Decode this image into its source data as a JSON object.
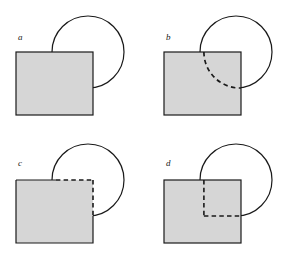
{
  "figure": {
    "title": "",
    "canvas": {
      "width": 296,
      "height": 256,
      "background": "#ffffff"
    },
    "colors": {
      "square_fill": "#d6d6d6",
      "outline": "#1a1a1a",
      "background": "#ffffff"
    },
    "panels": [
      {
        "label": "a",
        "label_x": 18,
        "label_y": 40,
        "description": "square overlapping circle, no hidden lines shown",
        "square": {
          "x": 16,
          "y": 52,
          "width": 77,
          "height": 63
        },
        "circle": {
          "cx": 88,
          "cy": 52,
          "r": 36
        },
        "hidden_style": "none"
      },
      {
        "label": "b",
        "label_x": 166,
        "label_y": 40,
        "description": "hidden arc of circle drawn dashed inside square",
        "square": {
          "x": 164,
          "y": 52,
          "width": 77,
          "height": 63
        },
        "circle": {
          "cx": 236,
          "cy": 52,
          "r": 36
        },
        "hidden_style": "dashed-arc"
      },
      {
        "label": "c",
        "label_x": 18,
        "label_y": 166,
        "description": "hidden square edges drawn dashed inside circle",
        "square": {
          "x": 16,
          "y": 180,
          "width": 77,
          "height": 63
        },
        "circle": {
          "cx": 88,
          "cy": 180,
          "r": 36
        },
        "hidden_style": "dashed-square-edges"
      },
      {
        "label": "d",
        "label_x": 166,
        "label_y": 166,
        "description": "dashed chords from circle intersections meeting at a right angle",
        "square": {
          "x": 164,
          "y": 180,
          "width": 77,
          "height": 63
        },
        "circle": {
          "cx": 236,
          "cy": 180,
          "r": 36
        },
        "hidden_style": "dashed-chords"
      }
    ]
  }
}
